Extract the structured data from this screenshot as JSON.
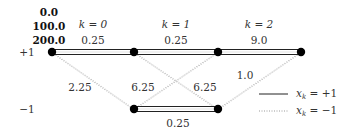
{
  "diagram": {
    "type": "trellis",
    "path_metrics": [
      "0.0",
      "100.0",
      "200.0"
    ],
    "stage_labels": [
      "k = 0",
      "k = 1",
      "k = 2"
    ],
    "state_labels": [
      "+1",
      "−1"
    ],
    "edges": {
      "top_0": "0.25",
      "top_1": "0.25",
      "top_2": "9.0",
      "diag_0_down": "2.25",
      "diag_1_up": "6.25",
      "diag_1_down": "6.25",
      "diag_2_up": "1.0",
      "bottom_1": "0.25"
    },
    "legend": {
      "solid_label": "x_k = +1",
      "dotted_label": "x_k = −1",
      "solid_text": "x",
      "solid_sub": "k",
      "solid_eq": " = +1",
      "dotted_text": "x",
      "dotted_sub": "k",
      "dotted_eq": " = −1"
    }
  }
}
